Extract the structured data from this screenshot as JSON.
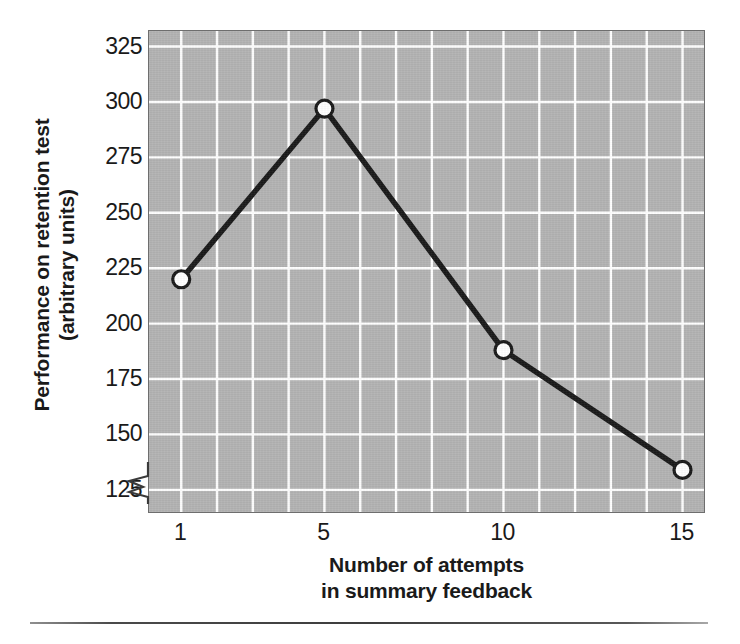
{
  "figure": {
    "background_color": "#ffffff",
    "panel_color": "#b3b3b3",
    "gridline_color": "#ffffff",
    "series_color": "#1a1a1a",
    "marker_fill": "#ffffff",
    "axis_break_present": true,
    "bottom_rule_present": true
  },
  "chart_data": {
    "type": "line",
    "title": "",
    "subtitle": "",
    "xlabel": "Number of attempts in summary feedback",
    "xlabel_line1": "Number of attempts",
    "xlabel_line2": "in summary feedback",
    "ylabel": "Performance on retention test (arbitrary units)",
    "ylabel_line1": "Performance on retention test",
    "ylabel_line2": "(arbitrary units)",
    "x": [
      1,
      5,
      10,
      15
    ],
    "values": [
      220,
      297,
      188,
      134
    ],
    "categories": [
      "1",
      "5",
      "10",
      "15"
    ],
    "xtick_labels": [
      "1",
      "5",
      "10",
      "15"
    ],
    "ytick_labels": [
      "125",
      "150",
      "175",
      "200",
      "225",
      "250",
      "275",
      "300",
      "325"
    ],
    "ytick_values": [
      125,
      150,
      175,
      200,
      225,
      250,
      275,
      300,
      325
    ],
    "ylim": [
      115,
      332
    ],
    "xlim": [
      0.1,
      15.6
    ],
    "grid": true,
    "grid_axis": "both",
    "legend": false,
    "legend_position": "none",
    "marker": "circle-open",
    "annotations": []
  }
}
